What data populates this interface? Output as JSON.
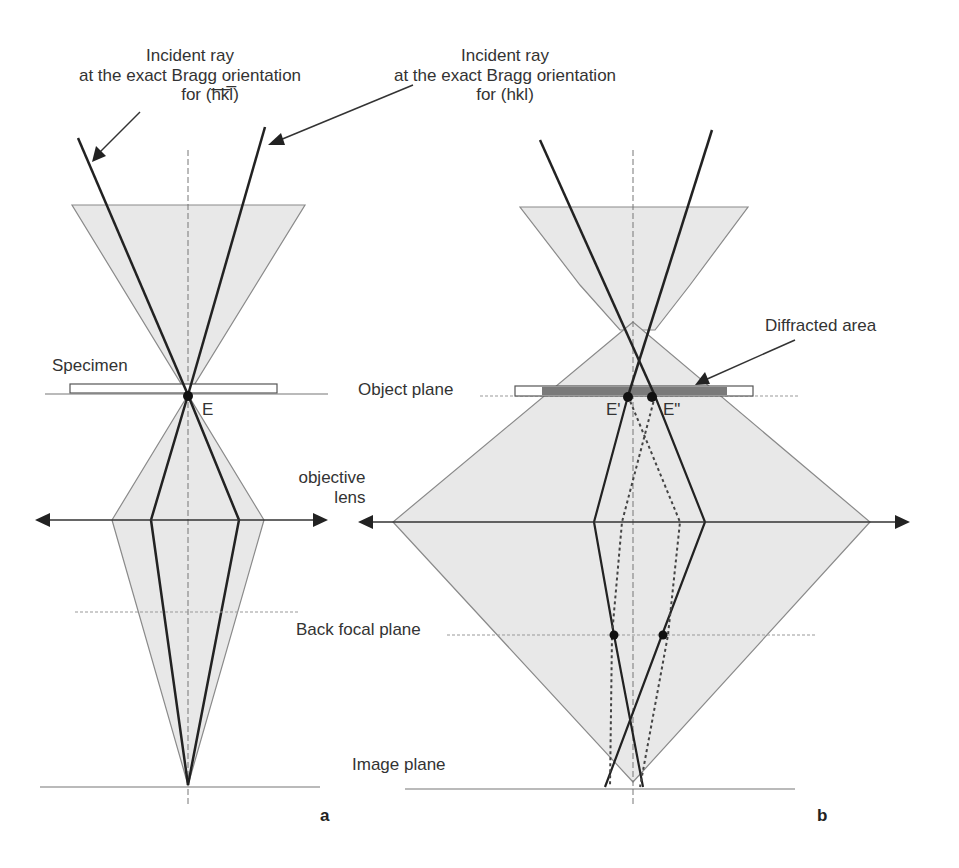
{
  "figure": {
    "panel_a": {
      "label": "a",
      "incident_ray_label": [
        "Incident ray",
        "at the exact Bragg orientation",
        "for (h̅k̅l̅)"
      ],
      "specimen_label": "Specimen",
      "point_label": "E"
    },
    "panel_b": {
      "label": "b",
      "incident_ray_label": [
        "Incident ray",
        "at the exact Bragg orientation",
        "for (hkl)"
      ],
      "diffracted_area_label": "Diffracted area",
      "object_plane_label": "Object plane",
      "objective_lens_label": [
        "objective",
        "lens"
      ],
      "back_focal_plane_label": "Back focal plane",
      "image_plane_label": "Image plane",
      "point_labels": [
        "E'",
        "E\""
      ]
    },
    "colors": {
      "cone_fill": "#e6e6e6",
      "cone_edge": "#8a8a8a",
      "ray": "#222222",
      "diffracted_band": "#7a7a7a"
    }
  }
}
